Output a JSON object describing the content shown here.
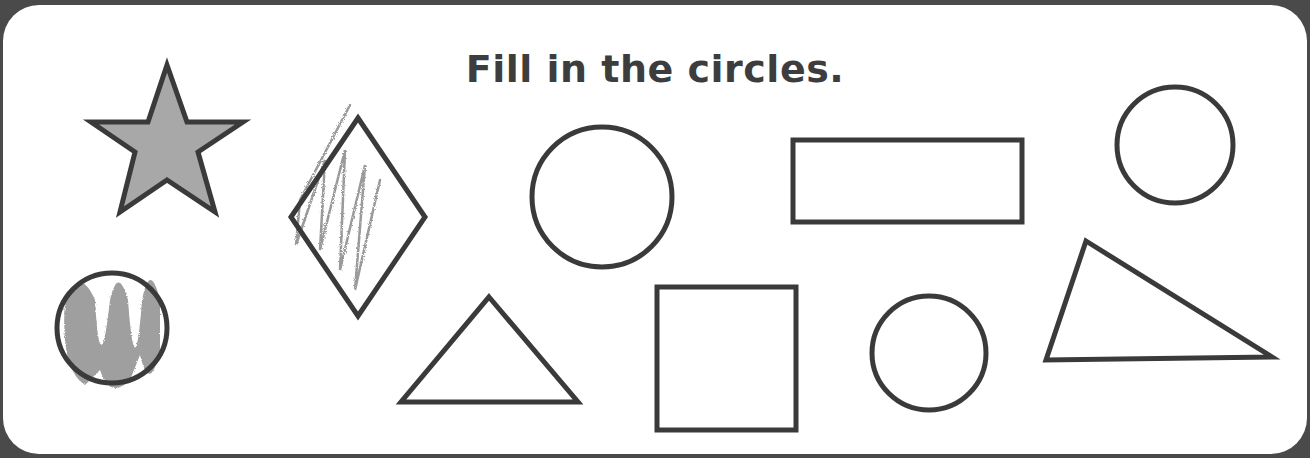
{
  "worksheet": {
    "instruction": "Fill in the circles.",
    "colors": {
      "outline": "#3a3a3a",
      "crayon": "#8a8a8a",
      "background": "#ffffff",
      "frame": "#4a4a4a"
    },
    "shapes": [
      {
        "type": "star",
        "colored_in": true
      },
      {
        "type": "diamond",
        "colored_in": "partially"
      },
      {
        "type": "circle",
        "colored_in": false
      },
      {
        "type": "rectangle",
        "colored_in": false
      },
      {
        "type": "circle",
        "colored_in": false
      },
      {
        "type": "circle",
        "colored_in": true
      },
      {
        "type": "triangle",
        "colored_in": false
      },
      {
        "type": "square",
        "colored_in": false
      },
      {
        "type": "circle",
        "colored_in": false
      },
      {
        "type": "triangle",
        "colored_in": false
      }
    ]
  }
}
